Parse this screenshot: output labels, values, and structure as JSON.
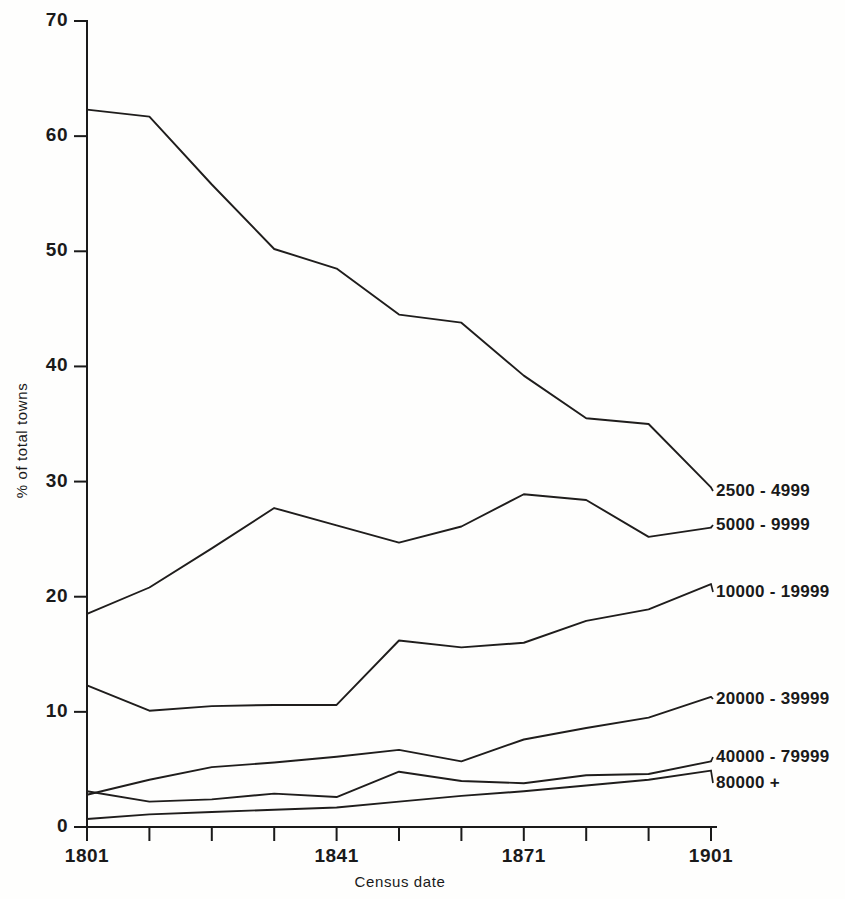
{
  "chart_data": {
    "type": "line",
    "title": "",
    "xlabel": "Census date",
    "ylabel": "% of total towns",
    "x": [
      1801,
      1811,
      1821,
      1831,
      1841,
      1851,
      1861,
      1871,
      1881,
      1891,
      1901
    ],
    "xtick_labels_shown": [
      "1801",
      "1841",
      "1871",
      "1901"
    ],
    "ytick_labels": [
      "0",
      "10",
      "20",
      "30",
      "40",
      "50",
      "60",
      "70"
    ],
    "xlim": [
      1801,
      1901
    ],
    "ylim": [
      0,
      70
    ],
    "grid": false,
    "legend_position": "right-inline-labels",
    "series": [
      {
        "name": "2500 - 4999",
        "values": [
          62.3,
          61.7,
          55.8,
          50.2,
          48.5,
          44.5,
          43.8,
          39.2,
          35.5,
          35.0,
          29.5
        ]
      },
      {
        "name": "5000 - 9999",
        "values": [
          18.5,
          20.8,
          24.2,
          27.7,
          26.2,
          24.7,
          26.1,
          28.9,
          28.4,
          25.2,
          26.0
        ]
      },
      {
        "name": "10000 - 19999",
        "values": [
          12.3,
          10.1,
          10.5,
          10.6,
          10.6,
          16.2,
          15.6,
          16.0,
          17.9,
          18.9,
          21.1
        ]
      },
      {
        "name": "20000 - 39999",
        "values": [
          2.8,
          4.1,
          5.2,
          5.6,
          6.1,
          6.7,
          5.7,
          7.6,
          8.6,
          9.5,
          11.3
        ]
      },
      {
        "name": "40000 - 79999",
        "values": [
          3.1,
          2.2,
          2.4,
          2.9,
          2.6,
          4.8,
          4.0,
          3.8,
          4.5,
          4.6,
          5.7
        ]
      },
      {
        "name": "80000 +",
        "values": [
          0.7,
          1.1,
          1.3,
          1.5,
          1.7,
          2.2,
          2.7,
          3.1,
          3.6,
          4.1,
          4.9
        ]
      }
    ]
  },
  "axes": {
    "y_title": "% of total towns",
    "x_title": "Census date",
    "y_ticks": [
      {
        "value": 70,
        "label": "70"
      },
      {
        "value": 60,
        "label": "60"
      },
      {
        "value": 50,
        "label": "50"
      },
      {
        "value": 40,
        "label": "40"
      },
      {
        "value": 30,
        "label": "30"
      },
      {
        "value": 20,
        "label": "20"
      },
      {
        "value": 10,
        "label": "10"
      },
      {
        "value": 0,
        "label": "0"
      }
    ],
    "x_ticks": [
      {
        "value": 1801,
        "label": "1801"
      },
      {
        "value": 1811,
        "label": ""
      },
      {
        "value": 1821,
        "label": ""
      },
      {
        "value": 1831,
        "label": ""
      },
      {
        "value": 1841,
        "label": "1841"
      },
      {
        "value": 1851,
        "label": ""
      },
      {
        "value": 1861,
        "label": ""
      },
      {
        "value": 1871,
        "label": "1871"
      },
      {
        "value": 1881,
        "label": ""
      },
      {
        "value": 1891,
        "label": ""
      },
      {
        "value": 1901,
        "label": "1901"
      }
    ]
  },
  "series_labels": [
    {
      "text": "2500 - 4999",
      "y_value": 29.5
    },
    {
      "text": "5000 - 9999",
      "y_value": 26.0
    },
    {
      "text": "10000 - 19999",
      "y_value": 21.1
    },
    {
      "text": "20000 - 39999",
      "y_value": 11.3
    },
    {
      "text": "40000 - 79999",
      "y_value": 5.7
    },
    {
      "text": "80000 +",
      "y_value": 4.9
    }
  ],
  "colors": {
    "line": "#1f1d1c",
    "axis": "#1a1a1a",
    "background": "#fefefd"
  }
}
